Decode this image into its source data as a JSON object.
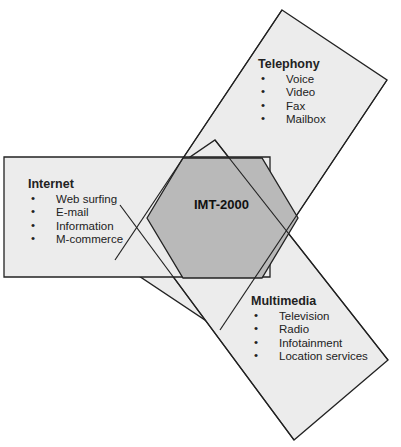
{
  "diagram": {
    "center": {
      "label": "IMT-2000",
      "fill": "#b9b9b9"
    },
    "band_fill": "#ececec",
    "stroke": "#222222",
    "groups": [
      {
        "title": "Telephony",
        "items": [
          "Voice",
          "Video",
          "Fax",
          "Mailbox"
        ]
      },
      {
        "title": "Internet",
        "items": [
          "Web surfing",
          "E-mail",
          "Information",
          "M-commerce"
        ]
      },
      {
        "title": "Multimedia",
        "items": [
          "Television",
          "Radio",
          "Infotainment",
          "Location services"
        ]
      }
    ],
    "bullet": "•"
  }
}
